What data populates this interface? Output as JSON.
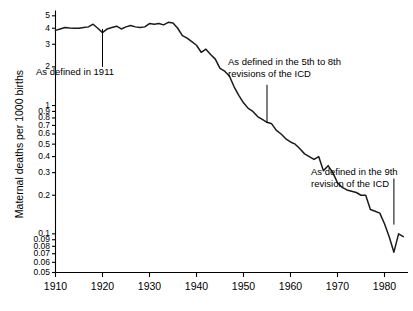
{
  "chart_data": {
    "type": "line",
    "title": "",
    "xlabel": "",
    "ylabel": "Maternal deaths per 1000 births",
    "yscale": "log",
    "xlim": [
      1910,
      1985
    ],
    "ylim": [
      0.05,
      5.5
    ],
    "grid": false,
    "legend": "none",
    "xticks": [
      1910,
      1920,
      1930,
      1940,
      1950,
      1960,
      1970,
      1980
    ],
    "yticks": [
      0.05,
      0.06,
      0.07,
      0.08,
      0.09,
      0.1,
      0.2,
      0.3,
      0.4,
      0.5,
      0.6,
      0.7,
      0.8,
      0.9,
      1,
      2,
      3,
      4,
      5
    ],
    "ytick_labels": [
      "0.05",
      "0.06",
      "0.07",
      "0.08",
      "0.09",
      "0.1",
      "0.2",
      "0.3",
      "0.4",
      "0.5",
      "0.6",
      "0.7",
      "0.8",
      "0.9",
      "1",
      "2",
      "3",
      "4",
      "5"
    ],
    "series": [
      {
        "name": "Maternal mortality rate",
        "x": [
          1910,
          1911,
          1912,
          1913,
          1914,
          1915,
          1916,
          1917,
          1918,
          1919,
          1920,
          1921,
          1922,
          1923,
          1924,
          1925,
          1926,
          1927,
          1928,
          1929,
          1930,
          1931,
          1932,
          1933,
          1934,
          1935,
          1936,
          1937,
          1938,
          1939,
          1940,
          1941,
          1942,
          1943,
          1944,
          1945,
          1946,
          1947,
          1948,
          1949,
          1950,
          1951,
          1952,
          1953,
          1954,
          1955,
          1956,
          1957,
          1958,
          1959,
          1960,
          1961,
          1962,
          1963,
          1964,
          1965,
          1966,
          1967,
          1968,
          1969,
          1970,
          1971,
          1972,
          1973,
          1974,
          1975,
          1976,
          1977,
          1978,
          1979,
          1980,
          1981,
          1982,
          1983,
          1984
        ],
        "y": [
          3.85,
          3.95,
          4.05,
          4.02,
          4.0,
          4.0,
          4.05,
          4.1,
          4.3,
          4.0,
          3.7,
          3.95,
          4.05,
          4.15,
          3.95,
          4.1,
          4.2,
          4.1,
          4.05,
          4.1,
          4.35,
          4.3,
          4.35,
          4.25,
          4.45,
          4.4,
          4.0,
          3.5,
          3.35,
          3.15,
          2.95,
          2.6,
          2.75,
          2.5,
          2.3,
          1.95,
          1.85,
          1.7,
          1.4,
          1.2,
          1.05,
          0.95,
          0.9,
          0.82,
          0.78,
          0.74,
          0.72,
          0.64,
          0.6,
          0.55,
          0.52,
          0.5,
          0.46,
          0.42,
          0.4,
          0.38,
          0.4,
          0.31,
          0.34,
          0.3,
          0.25,
          0.23,
          0.22,
          0.215,
          0.21,
          0.2,
          0.2,
          0.155,
          0.15,
          0.145,
          0.12,
          0.095,
          0.072,
          0.1,
          0.095
        ]
      }
    ],
    "annotations": [
      {
        "text": "As defined in 1911",
        "pointer_year": 1920,
        "pointer_value_top": 3.95,
        "pointer_value_bottom": 2.0
      },
      {
        "text": "As defined in the 5th to 8th\nrevisions of the ICD",
        "pointer_year": 1955,
        "pointer_value_top": 1.45,
        "pointer_value_bottom": 0.73
      },
      {
        "text": "As defined in the 9th\nrevision of the ICD",
        "pointer_year": 1982,
        "pointer_value_top": 0.27,
        "pointer_value_bottom": 0.118
      }
    ]
  },
  "figure": {
    "ylabel": "Maternal deaths per 1000 births"
  }
}
